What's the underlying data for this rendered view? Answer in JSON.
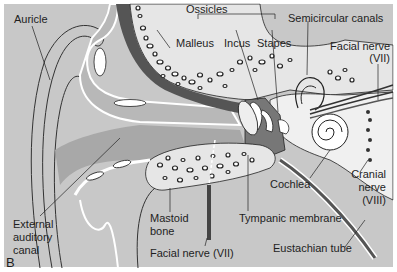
{
  "figure": {
    "panel_letter": "B",
    "colors": {
      "background": "#c8c8c8",
      "canal": "#a8a8a8",
      "skin": "#b8b8b8",
      "bone": "#e6e6e6",
      "dark_tissue": "#555555",
      "inner_ear": "#f0f0f0",
      "outline": "#222222",
      "border": "#ffffff"
    },
    "labels": {
      "auricle": "Auricle",
      "ossicles": "Ossicles",
      "malleus": "Malleus",
      "incus": "Incus",
      "stapes": "Stapes",
      "semicircular_canals": "Semicircular canals",
      "facial_nerve_top_1": "Facial nerve",
      "facial_nerve_top_2": "(VII)",
      "cochlea": "Cochlea",
      "cranial_nerve_1": "Cranial",
      "cranial_nerve_2": "nerve",
      "cranial_nerve_3": "(VIII)",
      "external_canal_1": "External",
      "external_canal_2": "auditory",
      "external_canal_3": "canal",
      "mastoid_1": "Mastoid",
      "mastoid_2": "bone",
      "tympanic_membrane": "Tympanic membrane",
      "facial_nerve_bottom": "Facial nerve (VII)",
      "eustachian_tube": "Eustachian tube"
    }
  }
}
